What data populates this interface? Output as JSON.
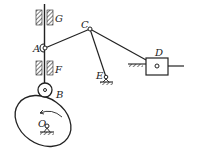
{
  "diagram": {
    "type": "mechanism-linkage",
    "labels": {
      "G": "G",
      "A": "A",
      "F": "F",
      "B": "B",
      "O": "O",
      "C": "C",
      "E": "E",
      "D": "D"
    },
    "elements": [
      {
        "name": "guide-G",
        "kind": "fixed guide"
      },
      {
        "name": "guide-F",
        "kind": "fixed guide"
      },
      {
        "name": "follower-rod",
        "kind": "translating follower"
      },
      {
        "name": "roller-B",
        "kind": "roller"
      },
      {
        "name": "cam-O",
        "kind": "elliptical cam",
        "rotation": "counterclockwise"
      },
      {
        "name": "link-AC",
        "kind": "coupler"
      },
      {
        "name": "link-CE",
        "kind": "rocker pivoted at E"
      },
      {
        "name": "link-CD",
        "kind": "connecting rod"
      },
      {
        "name": "slider-D",
        "kind": "slider"
      }
    ],
    "colors": {
      "stroke": "#222222",
      "background": "#ffffff"
    }
  }
}
